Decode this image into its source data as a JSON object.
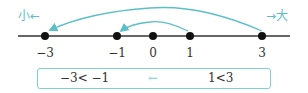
{
  "direction_labels": {
    "small": "小←",
    "large": "→大"
  },
  "number_line": {
    "points": [
      {
        "label": "−3",
        "value": -3,
        "x": 45
      },
      {
        "label": "−1",
        "value": -1,
        "x": 117
      },
      {
        "label": "0",
        "value": 0,
        "x": 153
      },
      {
        "label": "1",
        "value": 1,
        "x": 190
      },
      {
        "label": "3",
        "value": 3,
        "x": 262
      }
    ],
    "arrows": [
      {
        "from": 3,
        "to": -3
      },
      {
        "from": 1,
        "to": -1
      }
    ]
  },
  "summary_box": {
    "left_inequality": "−3< −1",
    "arrow": "←",
    "right_inequality": "1<3"
  },
  "colors": {
    "accent": "#5bbfc8",
    "axis": "#333333"
  }
}
